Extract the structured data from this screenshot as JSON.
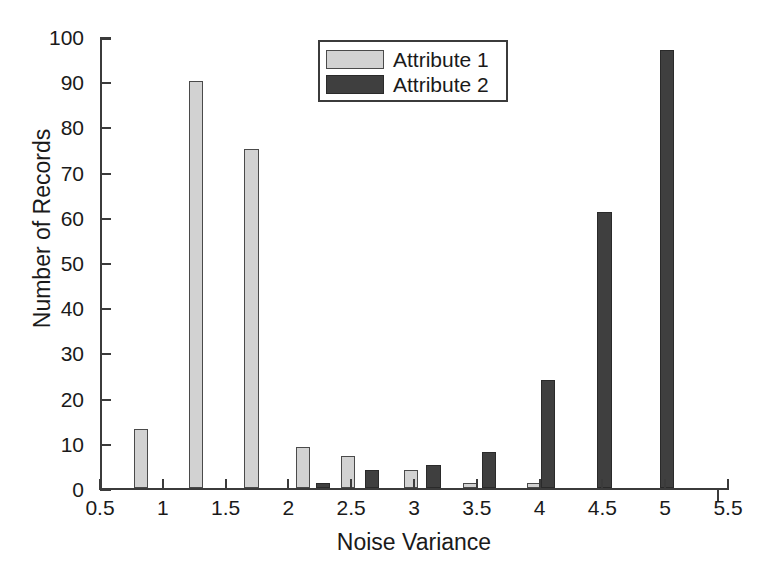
{
  "chart_data": {
    "type": "bar",
    "title": "",
    "subtitle": "",
    "xlabel": "Noise Variance",
    "ylabel": "Number of Records",
    "xlim": [
      0.5,
      5.5
    ],
    "ylim": [
      0,
      100
    ],
    "xticks": [
      "0.5",
      "1",
      "1.5",
      "2",
      "2.5",
      "3",
      "3.5",
      "4",
      "4.5",
      "5",
      "5.5"
    ],
    "xtick_values": [
      0.5,
      1,
      1.5,
      2,
      2.5,
      3,
      3.5,
      4,
      4.5,
      5,
      5.5
    ],
    "yticks": [
      "0",
      "10",
      "20",
      "30",
      "40",
      "50",
      "60",
      "70",
      "80",
      "90",
      "100"
    ],
    "ytick_values": [
      0,
      10,
      20,
      30,
      40,
      50,
      60,
      70,
      80,
      90,
      100
    ],
    "grid": false,
    "legend_position": "top-center",
    "bar_width": 0.115,
    "series": [
      {
        "name": "Attribute 1",
        "color": "#d2d2d2",
        "edge_color": "#4a4a4a",
        "points": [
          {
            "x": 0.81,
            "y": 13
          },
          {
            "x": 1.25,
            "y": 90
          },
          {
            "x": 1.69,
            "y": 75
          },
          {
            "x": 2.1,
            "y": 9
          },
          {
            "x": 2.46,
            "y": 7
          },
          {
            "x": 2.96,
            "y": 4
          },
          {
            "x": 3.43,
            "y": 1
          },
          {
            "x": 3.94,
            "y": 1
          }
        ]
      },
      {
        "name": "Attribute 2",
        "color": "#3f3f3f",
        "edge_color": "#2a2a2a",
        "points": [
          {
            "x": 2.26,
            "y": 1
          },
          {
            "x": 2.65,
            "y": 4
          },
          {
            "x": 3.14,
            "y": 5
          },
          {
            "x": 3.58,
            "y": 8
          },
          {
            "x": 4.05,
            "y": 24
          },
          {
            "x": 4.5,
            "y": 61
          },
          {
            "x": 5.0,
            "y": 97
          }
        ]
      }
    ]
  },
  "legend": {
    "entries": [
      {
        "label": "Attribute 1"
      },
      {
        "label": "Attribute 2"
      }
    ]
  },
  "axes": {
    "x_title": "Noise Variance",
    "y_title": "Number of Records"
  }
}
